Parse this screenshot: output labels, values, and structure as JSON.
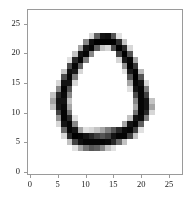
{
  "figure": {
    "background_color": "#ffffff",
    "axes_edge_color": "#9a9a9a",
    "tick_color": "#9a9a9a",
    "tick_label_color": "#1a1a1a",
    "caption": "",
    "axes_box": {
      "left": 27,
      "top": 9,
      "width": 156,
      "height": 166
    }
  },
  "x_axis": {
    "label": "",
    "ticks": [
      0,
      5,
      10,
      15,
      20,
      25
    ],
    "tick_labels": [
      "0",
      "5",
      "10",
      "15",
      "20",
      "25"
    ],
    "limits": [
      -0.5,
      27.5
    ]
  },
  "y_axis": {
    "label": "",
    "ticks": [
      0,
      5,
      10,
      15,
      20,
      25
    ],
    "tick_labels": [
      "0",
      "5",
      "10",
      "15",
      "20",
      "25"
    ],
    "limits": [
      27.5,
      -0.5
    ],
    "inverted": true
  },
  "chart_data": {
    "type": "heatmap",
    "title": "",
    "xlabel": "",
    "ylabel": "",
    "subtitle": "",
    "colormap": "gray_r",
    "vmin": 0,
    "vmax": 255,
    "grid": false,
    "legend": "none",
    "shape": [
      28,
      28
    ],
    "xlim": [
      -0.5,
      27.5
    ],
    "ylim": [
      27.5,
      -0.5
    ],
    "xticklabels": [
      "0",
      "5",
      "10",
      "15",
      "20",
      "25"
    ],
    "yticklabels": [
      "0",
      "5",
      "10",
      "15",
      "20",
      "25"
    ],
    "values": [
      [
        0,
        0,
        0,
        0,
        0,
        0,
        0,
        0,
        0,
        0,
        0,
        0,
        0,
        0,
        0,
        0,
        0,
        0,
        0,
        0,
        0,
        0,
        0,
        0,
        0,
        0,
        0,
        0
      ],
      [
        0,
        0,
        0,
        0,
        0,
        0,
        0,
        0,
        0,
        0,
        0,
        0,
        0,
        0,
        0,
        0,
        0,
        0,
        0,
        0,
        0,
        0,
        0,
        0,
        0,
        0,
        0,
        0
      ],
      [
        0,
        0,
        0,
        0,
        0,
        0,
        0,
        0,
        0,
        0,
        0,
        0,
        0,
        0,
        0,
        0,
        0,
        0,
        0,
        0,
        0,
        0,
        0,
        0,
        0,
        0,
        0,
        0
      ],
      [
        0,
        0,
        0,
        0,
        0,
        0,
        0,
        0,
        0,
        0,
        0,
        0,
        0,
        0,
        0,
        0,
        0,
        0,
        0,
        0,
        0,
        0,
        0,
        0,
        0,
        0,
        0,
        0
      ],
      [
        0,
        0,
        0,
        0,
        0,
        0,
        0,
        0,
        0,
        0,
        0,
        40,
        160,
        235,
        240,
        170,
        30,
        0,
        0,
        0,
        0,
        0,
        0,
        0,
        0,
        0,
        0,
        0
      ],
      [
        0,
        0,
        0,
        0,
        0,
        0,
        0,
        0,
        0,
        0,
        120,
        240,
        255,
        255,
        255,
        255,
        210,
        60,
        0,
        0,
        0,
        0,
        0,
        0,
        0,
        0,
        0,
        0
      ],
      [
        0,
        0,
        0,
        0,
        0,
        0,
        0,
        0,
        0,
        90,
        235,
        250,
        160,
        60,
        40,
        180,
        255,
        215,
        40,
        0,
        0,
        0,
        0,
        0,
        0,
        0,
        0,
        0
      ],
      [
        0,
        0,
        0,
        0,
        0,
        0,
        0,
        0,
        60,
        235,
        250,
        120,
        0,
        0,
        0,
        0,
        190,
        255,
        170,
        0,
        0,
        0,
        0,
        0,
        0,
        0,
        0,
        0
      ],
      [
        0,
        0,
        0,
        0,
        0,
        0,
        0,
        30,
        215,
        250,
        130,
        0,
        0,
        0,
        0,
        0,
        40,
        230,
        250,
        90,
        0,
        0,
        0,
        0,
        0,
        0,
        0,
        0
      ],
      [
        0,
        0,
        0,
        0,
        0,
        0,
        0,
        180,
        250,
        160,
        0,
        0,
        0,
        0,
        0,
        0,
        0,
        110,
        255,
        200,
        0,
        0,
        0,
        0,
        0,
        0,
        0,
        0
      ],
      [
        0,
        0,
        0,
        0,
        0,
        0,
        60,
        240,
        230,
        40,
        0,
        0,
        0,
        0,
        0,
        0,
        0,
        30,
        230,
        250,
        70,
        0,
        0,
        0,
        0,
        0,
        0,
        0
      ],
      [
        0,
        0,
        0,
        0,
        0,
        0,
        180,
        250,
        130,
        0,
        0,
        0,
        0,
        0,
        0,
        0,
        0,
        0,
        170,
        255,
        170,
        0,
        0,
        0,
        0,
        0,
        0,
        0
      ],
      [
        0,
        0,
        0,
        0,
        0,
        40,
        235,
        235,
        40,
        0,
        0,
        0,
        0,
        0,
        0,
        0,
        0,
        0,
        90,
        250,
        235,
        40,
        0,
        0,
        0,
        0,
        0,
        0
      ],
      [
        0,
        0,
        0,
        0,
        0,
        120,
        250,
        170,
        0,
        0,
        0,
        0,
        0,
        0,
        0,
        0,
        0,
        0,
        30,
        235,
        250,
        130,
        0,
        0,
        0,
        0,
        0,
        0
      ],
      [
        0,
        0,
        0,
        0,
        60,
        215,
        245,
        120,
        0,
        0,
        0,
        0,
        0,
        0,
        0,
        0,
        0,
        0,
        0,
        180,
        250,
        190,
        0,
        0,
        0,
        0,
        0,
        0
      ],
      [
        0,
        0,
        0,
        0,
        90,
        235,
        235,
        60,
        0,
        0,
        0,
        0,
        0,
        0,
        0,
        0,
        0,
        0,
        0,
        120,
        250,
        235,
        60,
        0,
        0,
        0,
        0,
        0
      ],
      [
        0,
        0,
        0,
        0,
        60,
        230,
        245,
        90,
        0,
        0,
        0,
        0,
        0,
        0,
        0,
        0,
        0,
        0,
        0,
        90,
        250,
        235,
        90,
        0,
        0,
        0,
        0,
        0
      ],
      [
        0,
        0,
        0,
        0,
        0,
        190,
        250,
        140,
        0,
        0,
        0,
        0,
        0,
        0,
        0,
        0,
        0,
        0,
        0,
        140,
        250,
        215,
        40,
        0,
        0,
        0,
        0,
        0
      ],
      [
        0,
        0,
        0,
        0,
        0,
        110,
        250,
        215,
        30,
        0,
        0,
        0,
        0,
        0,
        0,
        0,
        0,
        0,
        60,
        235,
        245,
        130,
        0,
        0,
        0,
        0,
        0,
        0
      ],
      [
        0,
        0,
        0,
        0,
        0,
        40,
        235,
        250,
        120,
        0,
        0,
        0,
        0,
        0,
        0,
        0,
        0,
        90,
        235,
        250,
        160,
        0,
        0,
        0,
        0,
        0,
        0,
        0
      ],
      [
        0,
        0,
        0,
        0,
        0,
        0,
        150,
        250,
        235,
        90,
        30,
        40,
        60,
        90,
        130,
        170,
        215,
        245,
        250,
        190,
        30,
        0,
        0,
        0,
        0,
        0,
        0,
        0
      ],
      [
        0,
        0,
        0,
        0,
        0,
        0,
        40,
        215,
        255,
        250,
        235,
        215,
        190,
        170,
        190,
        235,
        250,
        250,
        190,
        60,
        0,
        0,
        0,
        0,
        0,
        0,
        0,
        0
      ],
      [
        0,
        0,
        0,
        0,
        0,
        0,
        0,
        60,
        190,
        240,
        250,
        250,
        250,
        250,
        245,
        215,
        150,
        60,
        0,
        0,
        0,
        0,
        0,
        0,
        0,
        0,
        0,
        0
      ],
      [
        0,
        0,
        0,
        0,
        0,
        0,
        0,
        0,
        30,
        90,
        140,
        170,
        160,
        120,
        60,
        30,
        0,
        0,
        0,
        0,
        0,
        0,
        0,
        0,
        0,
        0,
        0,
        0
      ],
      [
        0,
        0,
        0,
        0,
        0,
        0,
        0,
        0,
        0,
        0,
        0,
        0,
        0,
        0,
        0,
        0,
        0,
        0,
        0,
        0,
        0,
        0,
        0,
        0,
        0,
        0,
        0,
        0
      ],
      [
        0,
        0,
        0,
        0,
        0,
        0,
        0,
        0,
        0,
        0,
        0,
        0,
        0,
        0,
        0,
        0,
        0,
        0,
        0,
        0,
        0,
        0,
        0,
        0,
        0,
        0,
        0,
        0
      ],
      [
        0,
        0,
        0,
        0,
        0,
        0,
        0,
        0,
        0,
        0,
        0,
        0,
        0,
        0,
        0,
        0,
        0,
        0,
        0,
        0,
        0,
        0,
        0,
        0,
        0,
        0,
        0,
        0
      ],
      [
        0,
        0,
        0,
        0,
        0,
        0,
        0,
        0,
        0,
        0,
        0,
        0,
        0,
        0,
        0,
        0,
        0,
        0,
        0,
        0,
        0,
        0,
        0,
        0,
        0,
        0,
        0,
        0
      ]
    ]
  }
}
